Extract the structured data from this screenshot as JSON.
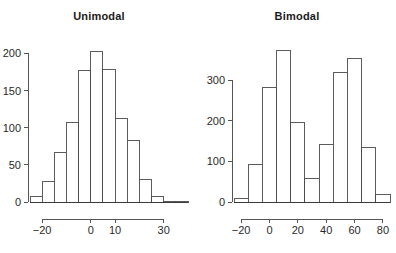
{
  "figure": {
    "background": "#ffffff",
    "bar_fill": "#ffffff",
    "bar_stroke": "#4a4a4a",
    "axis_color": "#555555",
    "text_color": "#1b1b1b"
  },
  "panels": [
    {
      "key": "unimodal",
      "title": "Unimodal"
    },
    {
      "key": "bimodal",
      "title": "Bimodal"
    }
  ],
  "chart_data": [
    {
      "type": "bar",
      "title": "Unimodal",
      "xlabel": "",
      "ylabel": "",
      "grid": false,
      "legend": "none",
      "bin_width": 5,
      "bin_starts": [
        -25,
        -20,
        -15,
        -10,
        -5,
        0,
        5,
        10,
        15,
        20,
        25,
        30,
        35
      ],
      "categories": [
        "-25",
        "-20",
        "-15",
        "-10",
        "-5",
        "0",
        "5",
        "10",
        "15",
        "20",
        "25",
        "30",
        "35"
      ],
      "values": [
        7,
        27,
        67,
        107,
        177,
        202,
        179,
        112,
        83,
        30,
        8,
        1,
        1
      ],
      "xlim": [
        -25,
        40
      ],
      "ylim": [
        0,
        210
      ],
      "xticks": [
        -20,
        0,
        10,
        30
      ],
      "xticklabels": [
        "−20",
        "0",
        "10",
        "30"
      ],
      "yticks": [
        0,
        50,
        100,
        150,
        200
      ],
      "yticklabels": [
        "0",
        "50",
        "100",
        "150",
        "200"
      ]
    },
    {
      "type": "bar",
      "title": "Bimodal",
      "xlabel": "",
      "ylabel": "",
      "grid": false,
      "legend": "none",
      "bin_width": 10,
      "bin_starts": [
        -25,
        -15,
        -5,
        5,
        15,
        25,
        35,
        45,
        55,
        65,
        75
      ],
      "categories": [
        "-25",
        "-15",
        "-5",
        "5",
        "15",
        "25",
        "35",
        "45",
        "55",
        "65",
        "75"
      ],
      "values": [
        8,
        93,
        283,
        375,
        197,
        57,
        143,
        320,
        353,
        135,
        18
      ],
      "xlim": [
        -25,
        85
      ],
      "ylim": [
        0,
        385
      ],
      "xticks": [
        -20,
        0,
        20,
        40,
        60,
        80
      ],
      "xticklabels": [
        "−20",
        "0",
        "20",
        "40",
        "60",
        "80"
      ],
      "yticks": [
        0,
        100,
        200,
        300
      ],
      "yticklabels": [
        "0",
        "100",
        "200",
        "300"
      ]
    }
  ]
}
